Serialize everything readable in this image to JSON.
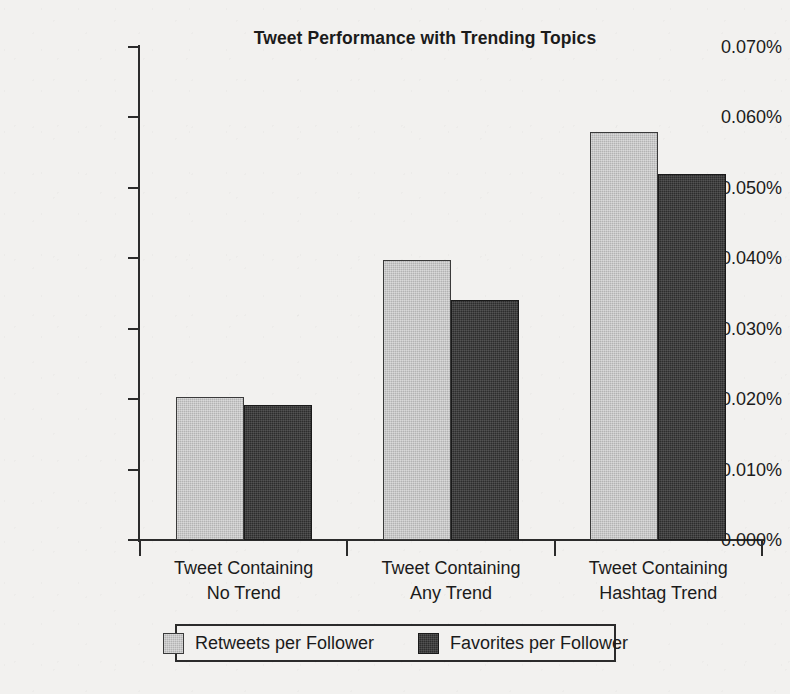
{
  "chart_data": {
    "type": "bar",
    "title": "Tweet Performance with Trending Topics",
    "xlabel": "",
    "ylabel": "",
    "categories": [
      "Tweet Containing\nNo Trend",
      "Tweet Containing\nAny Trend",
      "Tweet Containing\nHashtag Trend"
    ],
    "series": [
      {
        "name": "Retweets per Follower",
        "color": "#b3b3b3",
        "values": [
          0.0203,
          0.0398,
          0.058
        ]
      },
      {
        "name": "Favorites per Follower",
        "color": "#2d2d2d",
        "values": [
          0.0192,
          0.0341,
          0.052
        ]
      }
    ],
    "ylim": [
      0.0,
      0.07
    ],
    "ytick_step": 0.01,
    "ytick_labels": [
      "0.000%",
      "0.010%",
      "0.020%",
      "0.030%",
      "0.040%",
      "0.050%",
      "0.060%",
      "0.070%"
    ],
    "ytick_values": [
      0.0,
      0.01,
      0.02,
      0.03,
      0.04,
      0.05,
      0.06,
      0.07
    ],
    "grid": false,
    "legend_position": "bottom",
    "value_format": "percent"
  },
  "legend": {
    "entries": [
      {
        "label": "Retweets per Follower",
        "swatch": "light-gray-swatch"
      },
      {
        "label": "Favorites per Follower",
        "swatch": "dark-swatch"
      }
    ]
  },
  "colors": {
    "background": "#f2f1ef",
    "axis": "#2b2b2b",
    "text": "#1b1b1b",
    "series_light": "#b3b3b3",
    "series_dark": "#2d2d2d"
  }
}
